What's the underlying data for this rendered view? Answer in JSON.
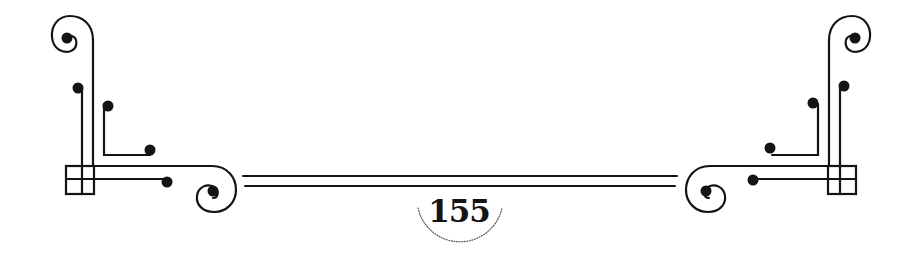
{
  "page": {
    "number": "155"
  },
  "ornament": {
    "color": "#141414",
    "arc_color": "#555555"
  }
}
